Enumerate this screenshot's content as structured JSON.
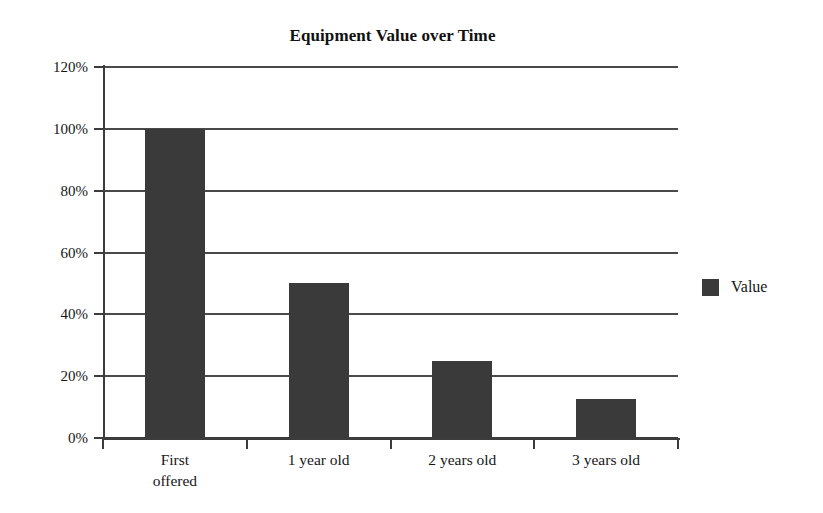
{
  "chart_data": {
    "type": "bar",
    "title": "Equipment Value over Time",
    "xlabel": "",
    "ylabel": "",
    "categories": [
      "First offered",
      "1 year old",
      "2 years old",
      "3 years old"
    ],
    "category_lines": [
      [
        "First",
        "offered"
      ],
      [
        "1 year old"
      ],
      [
        "2 years old"
      ],
      [
        "3 years old"
      ]
    ],
    "series": [
      {
        "name": "Value",
        "values": [
          100,
          50,
          25,
          12.5
        ],
        "color": "#3a3a3a"
      }
    ],
    "ylim": [
      0,
      120
    ],
    "ytick_values": [
      0,
      20,
      40,
      60,
      80,
      100,
      120
    ],
    "ytick_labels": [
      "0%",
      "20%",
      "40%",
      "60%",
      "80%",
      "100%",
      "120%"
    ],
    "grid": "horizontal",
    "legend_position": "right",
    "legend_entries": [
      {
        "label": "Value",
        "color": "#3a3a3a"
      }
    ],
    "background_color": "#ffffff",
    "axis_color": "#3c3c3c",
    "gridline_color": "#4a4a4a"
  }
}
